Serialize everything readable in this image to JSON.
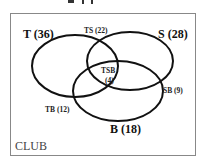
{
  "diagram": {
    "type": "venn",
    "universe_label": "CLUB",
    "sets": [
      {
        "id": "T",
        "label": "T (36)",
        "name": "T",
        "count": 36
      },
      {
        "id": "S",
        "label": "S (28)",
        "name": "S",
        "count": 28
      },
      {
        "id": "B",
        "label": "B (18)",
        "name": "B",
        "count": 18
      }
    ],
    "intersections": [
      {
        "id": "TS",
        "label": "TS (22)",
        "sets": [
          "T",
          "S"
        ],
        "count": 22
      },
      {
        "id": "SB",
        "label": "SB (9)",
        "sets": [
          "S",
          "B"
        ],
        "count": 9
      },
      {
        "id": "TB",
        "label": "TB (12)",
        "sets": [
          "T",
          "B"
        ],
        "count": 12
      },
      {
        "id": "TSB",
        "label_top": "TSB",
        "label_bottom": "(4)",
        "sets": [
          "T",
          "S",
          "B"
        ],
        "count": 4
      }
    ],
    "colors": {
      "stroke": "#111111",
      "frame": "#888888",
      "background": "#ffffff"
    }
  }
}
